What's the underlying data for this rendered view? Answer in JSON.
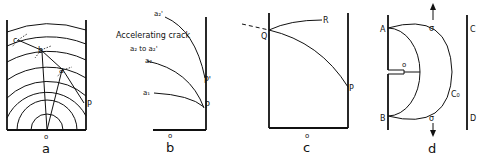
{
  "figure": {
    "panels": [
      {
        "id": "a",
        "caption": "a",
        "labels": {
          "origin": "o",
          "points": [
            "c",
            "b",
            "a",
            "P"
          ]
        },
        "description": "Concentric semicircular wave fronts centered at o within a strip; crack path through c, b, a toward P with rays from o"
      },
      {
        "id": "b",
        "caption": "b",
        "labels": {
          "origin": "o",
          "annotation": "Accelerating crack",
          "annotation_sub": "a₂ to a₂'",
          "curves": [
            "a₂'",
            "a₂",
            "a₁"
          ],
          "points": [
            "P'",
            "P"
          ]
        },
        "description": "Crack trajectories a1, a2, a2' curving to meet the edge at P and P'"
      },
      {
        "id": "c",
        "caption": "c",
        "labels": {
          "origin": "o",
          "points": [
            "Q",
            "R",
            "P"
          ]
        },
        "description": "Curved crack from P to Q at the opposite edge, branching to R; dashed extension beyond Q"
      },
      {
        "id": "d",
        "caption": "d",
        "labels": {
          "origin": "o",
          "points": [
            "A",
            "B",
            "C",
            "D"
          ],
          "circle": "C₀",
          "stress_top": "σ",
          "stress_bottom": "σ"
        },
        "description": "Edge notch at o with semicircles through A and B, outer circle C0, parallel edge CD, tensile stress σ arrows"
      }
    ]
  }
}
